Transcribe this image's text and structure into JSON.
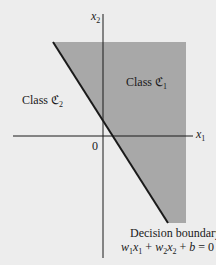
{
  "diagram": {
    "type": "linear-decision-boundary",
    "axes": {
      "x1": {
        "label": "x",
        "subscript": "1"
      },
      "x2": {
        "label": "x",
        "subscript": "2"
      },
      "origin_label": "0"
    },
    "regions": [
      {
        "name": "Class C1",
        "label": "Class ℂ",
        "script": "𝒞",
        "text": "Class",
        "symbol": "ℭ",
        "subscript": "1",
        "shaded": true
      },
      {
        "name": "Class C2",
        "text": "Class",
        "symbol": "ℭ",
        "subscript": "2",
        "shaded": false
      }
    ],
    "boundary": {
      "title": "Decision boundary",
      "equation": {
        "w1": "w",
        "w1_sub": "1",
        "x1": "x",
        "x1_sub": "1",
        "plus1": " + ",
        "w2": "w",
        "w2_sub": "2",
        "x2": "x",
        "x2_sub": "2",
        "plus2": " + ",
        "b": "b",
        "eq": " = 0"
      }
    },
    "colors": {
      "background": "#ededed",
      "shaded_region": "#a8a8a8",
      "lines": "#1a1a1a"
    }
  }
}
